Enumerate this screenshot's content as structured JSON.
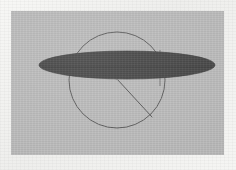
{
  "figure": {
    "kind": "geometry-diagram",
    "canvas": {
      "width": 236,
      "height": 170
    },
    "panel": {
      "name": "diagram-panel",
      "x": 11,
      "y": 11,
      "width": 213,
      "height": 144,
      "fill_color": "#bcbcbc"
    },
    "background": {
      "margin_color": "#f3f3f1",
      "description": "scanned white paper margin surrounding the gray figure panel"
    }
  },
  "shapes": {
    "ellipse": {
      "name": "disk-ellipse",
      "cx": 127,
      "cy": 65,
      "rx": 88,
      "ry": 14,
      "fill_color": "#4a4a4a",
      "stroke_color": "#3d3d3d",
      "stroke_width": 0.6,
      "left_tip_x": 39,
      "right_tip_x": 215,
      "top_y": 51,
      "bottom_y": 79
    },
    "circle": {
      "name": "outline-circle",
      "cx": 117,
      "cy": 80,
      "r": 48,
      "fill": "none",
      "stroke_color": "#5e5e5e",
      "stroke_width": 1.0,
      "top_y": 32,
      "bottom_y": 128,
      "left_x": 69,
      "right_x": 165
    },
    "radius_line": {
      "name": "radius-line",
      "x1": 117,
      "y1": 79,
      "x2": 152,
      "y2": 117,
      "stroke_color": "#4f4f4f",
      "stroke_width": 0.9
    },
    "center_point": {
      "name": "center-point",
      "cx": 117,
      "cy": 79,
      "r": 1.3,
      "fill_color": "#9a9a9a"
    },
    "chord_line": {
      "name": "ellipse-major-axis",
      "x1": 42,
      "y1": 67,
      "x2": 213,
      "y2": 67,
      "stroke_color": "#3a3a3a",
      "stroke_width": 0.5
    },
    "vertical_tick": {
      "name": "right-vertical-tick",
      "x1": 160,
      "y1": 50,
      "x2": 160,
      "y2": 86,
      "stroke_color": "#4a4a4a",
      "stroke_width": 0.7
    }
  },
  "accessibility": {
    "figure_alt": "A dark flattened ellipse drawn across a thin circle outline, with a straight line from the circle center to the lower-right of the circumference.",
    "panel_caption": ""
  }
}
